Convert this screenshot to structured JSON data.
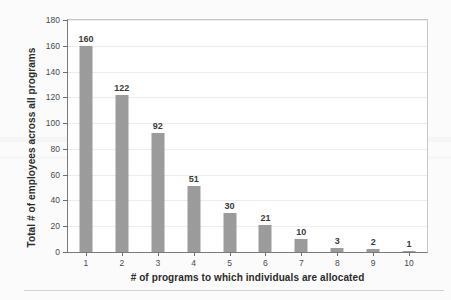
{
  "chart_data": {
    "type": "bar",
    "title": "",
    "xlabel": "# of programs to which individuals are allocated",
    "ylabel": "Total # of employees across all programs",
    "categories": [
      "1",
      "2",
      "3",
      "4",
      "5",
      "6",
      "7",
      "8",
      "9",
      "10"
    ],
    "values": [
      160,
      122,
      92,
      51,
      30,
      21,
      10,
      3,
      2,
      1
    ],
    "value_labels": [
      "160",
      "122",
      "92",
      "51",
      "30",
      "21",
      "10",
      "3",
      "2",
      "1"
    ],
    "ylim": [
      0,
      180
    ],
    "ytick_values": [
      0,
      20,
      40,
      60,
      80,
      100,
      120,
      140,
      160,
      180
    ],
    "ytick_labels": [
      "0",
      "20",
      "40",
      "60",
      "80",
      "100",
      "120",
      "140",
      "160",
      "180"
    ],
    "grid": true,
    "legend": "none",
    "bar_color": "#9b9b9b",
    "series": [
      {
        "name": "Total # of employees",
        "values": [
          160,
          122,
          92,
          51,
          30,
          21,
          10,
          3,
          2,
          1
        ]
      }
    ]
  },
  "figure": {
    "background_color": "#fbfbfb",
    "plot_background_color": "#ffffff",
    "axis_color": "#7a7a7a",
    "gridline_color": "#ececec",
    "text_color": "#2b2b2b"
  }
}
